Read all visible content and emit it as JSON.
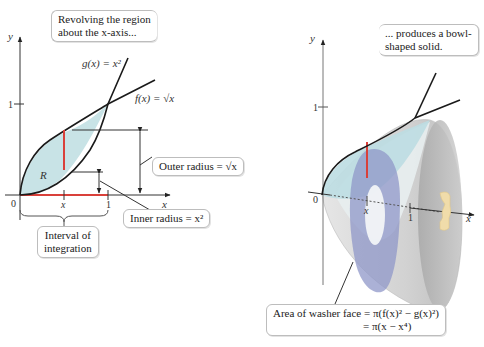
{
  "left_panel": {
    "callout_top": [
      "Revolving the region",
      "about the x-axis..."
    ],
    "y_axis_label": "y",
    "x_axis_label": "x",
    "tick_y_1": "1",
    "tick_x_0": "0",
    "tick_x_x": "x",
    "tick_x_1": "1",
    "g_label": "g(x) = x²",
    "f_label": "f(x) = √x",
    "region_label": "R",
    "outer_radius": "Outer radius = √x",
    "inner_radius": "Inner radius = x²",
    "interval": [
      "Interval of",
      "integration"
    ]
  },
  "right_panel": {
    "callout_top": [
      "... produces a bowl-",
      "shaped solid."
    ],
    "y_axis_label": "y",
    "x_axis_label": "x",
    "tick_y_1": "1",
    "tick_x_0": "0",
    "tick_x_x": "x",
    "tick_x_1": "1",
    "washer_area": [
      "Area of washer face = π(f(x)² − g(x)²)",
      "= π(x − x⁴)"
    ]
  },
  "colors": {
    "region_fill": "#c8e3e6",
    "curve": "#1a1a1a",
    "highlight_red": "#d9403a",
    "solid_gray": "#c9c9c9",
    "washer_blue": "#8f97c8",
    "rotation_arrow": "#f0dcaa"
  }
}
